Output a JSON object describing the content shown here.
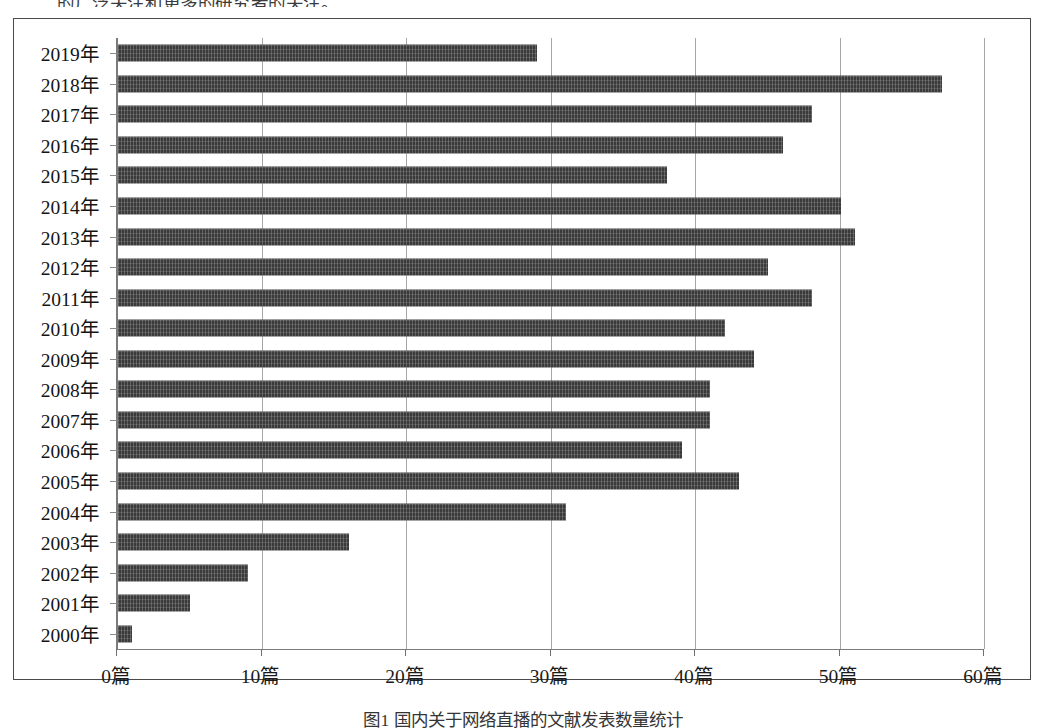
{
  "page": {
    "top_text": "的广泛关注和更多的研究者的关注。",
    "caption": "图1  国内关于网络直播的文献发表数量统计"
  },
  "chart_data": {
    "type": "bar",
    "orientation": "horizontal",
    "title": "",
    "xlabel": "",
    "ylabel": "",
    "categories": [
      "2019年",
      "2018年",
      "2017年",
      "2016年",
      "2015年",
      "2014年",
      "2013年",
      "2012年",
      "2011年",
      "2010年",
      "2009年",
      "2008年",
      "2007年",
      "2006年",
      "2005年",
      "2004年",
      "2003年",
      "2002年",
      "2001年",
      "2000年"
    ],
    "values": [
      29,
      57,
      48,
      46,
      38,
      50,
      51,
      45,
      48,
      42,
      44,
      41,
      41,
      39,
      43,
      31,
      16,
      9,
      5,
      1
    ],
    "unit": "篇",
    "xlim": [
      0,
      60
    ],
    "xticks": [
      0,
      10,
      20,
      30,
      40,
      50,
      60
    ],
    "xtick_labels": [
      "0篇",
      "10篇",
      "20篇",
      "30篇",
      "40篇",
      "50篇",
      "60篇"
    ],
    "grid": true,
    "legend": false,
    "bar_color": "#3a3a3a",
    "axis_color": "#7b7b7b",
    "grid_color": "#a7a7a7"
  }
}
